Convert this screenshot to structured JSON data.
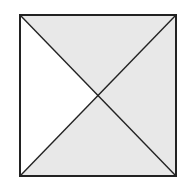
{
  "diagram": {
    "type": "square-with-diagonals",
    "square": {
      "x": 20,
      "y": 15,
      "size": 156
    },
    "regions": [
      {
        "name": "top-triangle",
        "fill": "#e8e8e8"
      },
      {
        "name": "right-triangle",
        "fill": "#e8e8e8"
      },
      {
        "name": "bottom-triangle",
        "fill": "#e8e8e8"
      },
      {
        "name": "left-triangle",
        "fill": "#ffffff"
      }
    ],
    "stroke_color": "#222222",
    "shaded_fraction": "3/4"
  }
}
